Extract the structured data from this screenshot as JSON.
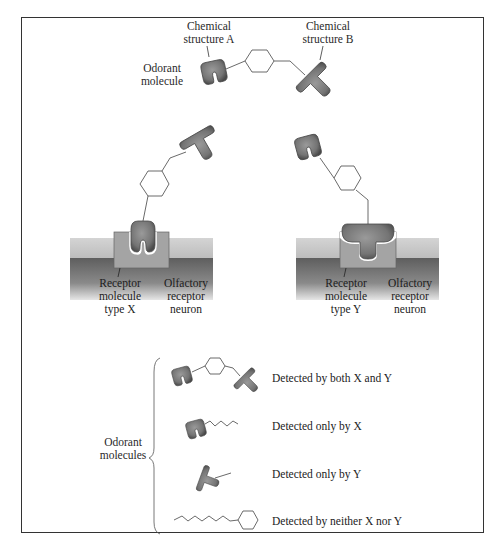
{
  "diagram": {
    "top": {
      "label_structure_a": [
        "Chemical",
        "structure A"
      ],
      "label_structure_b": [
        "Chemical",
        "structure B"
      ],
      "label_odorant": [
        "Odorant",
        "molecule"
      ]
    },
    "receptor_x": {
      "receptor_label": [
        "Receptor",
        "molecule",
        "type X"
      ],
      "neuron_label": [
        "Olfactory",
        "receptor",
        "neuron"
      ]
    },
    "receptor_y": {
      "receptor_label": [
        "Receptor",
        "molecule",
        "type Y"
      ],
      "neuron_label": [
        "Olfactory",
        "receptor",
        "neuron"
      ]
    },
    "legend": {
      "group_label": [
        "Odorant",
        "molecules"
      ],
      "items": [
        {
          "text": "Detected by both X and Y"
        },
        {
          "text": "Detected only by X"
        },
        {
          "text": "Detected only by Y"
        },
        {
          "text": "Detected by neither X nor Y"
        }
      ]
    },
    "colors": {
      "molecule_fill": "#7a7a7a",
      "molecule_dark": "#4a4a4a",
      "membrane_light": "#c8c8c8",
      "membrane_dark": "#6e6e6e",
      "receptor_fill": "#a9a9a9",
      "border": "#333333"
    }
  }
}
